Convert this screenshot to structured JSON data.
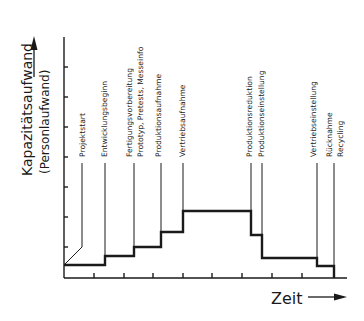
{
  "diagram": {
    "y_axis_label": "Kapazitätsaufwand",
    "y_axis_sublabel": "(Personlaufwand)",
    "x_axis_label": "Zeit",
    "colors": {
      "line": "#1a1a1a",
      "background": "#ffffff"
    },
    "events": [
      {
        "id": "projektstart",
        "labels": [
          "Projektstart"
        ]
      },
      {
        "id": "entwicklungsbeginn",
        "labels": [
          "Entwicklungsbeginn"
        ]
      },
      {
        "id": "fertigung",
        "labels": [
          "Fertigungsvorbereitung",
          "Prototyp, Pretests, Messeinfo"
        ]
      },
      {
        "id": "produktionsaufnahme",
        "labels": [
          "Produktionsaufnahme"
        ]
      },
      {
        "id": "vertriebsaufnahme",
        "labels": [
          "Vertriebsaufnahme"
        ]
      },
      {
        "id": "produktionsreduktion",
        "labels": [
          "Produktionsreduktion"
        ]
      },
      {
        "id": "produktionseinstellung",
        "labels": [
          "Produktionseinstellung"
        ]
      },
      {
        "id": "vertriebseinstellung",
        "labels": [
          "Vertriebseinstellung"
        ]
      },
      {
        "id": "ruecknahme-recycling",
        "labels": [
          "Rücknahme",
          "Recycling"
        ]
      }
    ],
    "step_profile": {
      "description": "Capacity effort rises stepwise from project start to a plateau after sales launch, then falls stepwise to zero at recycling",
      "levels": [
        {
          "phase": "Projektstart → Entwicklungsbeginn",
          "level": 1
        },
        {
          "phase": "Entwicklungsbeginn → Fertigungsvorbereitung",
          "level": 2
        },
        {
          "phase": "Fertigungsvorbereitung → Produktionsaufnahme",
          "level": 3
        },
        {
          "phase": "Produktionsaufnahme → Vertriebsaufnahme",
          "level": 4.5
        },
        {
          "phase": "Vertriebsaufnahme → Produktionsreduktion",
          "level": 6
        },
        {
          "phase": "Produktionsreduktion → Produktionseinstellung",
          "level": 3.5
        },
        {
          "phase": "Produktionseinstellung → Vertriebseinstellung",
          "level": 1.2
        },
        {
          "phase": "Vertriebseinstellung → Rücknahme/Recycling",
          "level": 0.4
        }
      ]
    }
  }
}
